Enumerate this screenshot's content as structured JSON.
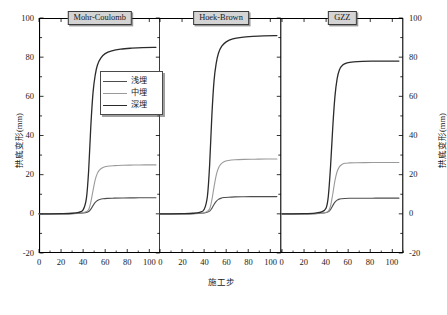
{
  "chart_data": {
    "type": "line",
    "title": "",
    "xlabel": "施工步",
    "ylabel": "拱底变形(mm)",
    "xlim": [
      0,
      110
    ],
    "ylim": [
      -20,
      100
    ],
    "xticks": [
      0,
      20,
      40,
      60,
      80,
      100
    ],
    "yticks": [
      -20,
      0,
      20,
      40,
      60,
      80,
      100
    ],
    "grid": false,
    "legend_position": "inside-left-panel-upper-right",
    "panels": [
      {
        "label": "Mohr-Coulomb",
        "series": [
          {
            "name": "浅埋",
            "color": "#4d4d4d",
            "width": 1.1,
            "plateau": 8.2,
            "x": [
              0,
              10,
              20,
              30,
              38,
              42,
              45,
              47,
              49,
              51,
              53,
              55,
              58,
              62,
              68,
              76,
              86,
              96,
              106
            ],
            "y": [
              0,
              0,
              0,
              0.1,
              0.3,
              0.6,
              1.2,
              2.4,
              4.2,
              5.8,
              6.8,
              7.3,
              7.7,
              7.9,
              8.0,
              8.1,
              8.15,
              8.2,
              8.2
            ]
          },
          {
            "name": "中埋",
            "color": "#9a9a9a",
            "width": 1.1,
            "plateau": 25.0,
            "x": [
              0,
              10,
              20,
              30,
              38,
              42,
              45,
              47,
              49,
              51,
              53,
              55,
              58,
              62,
              68,
              76,
              86,
              96,
              106
            ],
            "y": [
              0,
              0,
              0,
              0.1,
              0.4,
              0.9,
              2.2,
              6.0,
              12.0,
              17.5,
              20.8,
              22.5,
              23.7,
              24.3,
              24.6,
              24.8,
              24.9,
              25.0,
              25.0
            ]
          },
          {
            "name": "深埋",
            "color": "#2b2b2b",
            "width": 1.3,
            "plateau": 85.0,
            "x": [
              0,
              10,
              20,
              30,
              36,
              40,
              43,
              45,
              47,
              49,
              51,
              53,
              56,
              60,
              66,
              74,
              84,
              94,
              106
            ],
            "y": [
              0,
              0,
              0.1,
              0.3,
              0.8,
              2.0,
              8.0,
              22.0,
              45.0,
              62.0,
              71.0,
              76.0,
              79.5,
              81.8,
              83.2,
              84.1,
              84.6,
              84.9,
              85.0
            ]
          }
        ]
      },
      {
        "label": "Hoek-Brown",
        "series": [
          {
            "name": "浅埋",
            "color": "#4d4d4d",
            "width": 1.1,
            "plateau": 8.8,
            "x": [
              0,
              10,
              20,
              30,
              38,
              42,
              45,
              47,
              49,
              51,
              53,
              55,
              58,
              62,
              68,
              76,
              86,
              96,
              106
            ],
            "y": [
              0,
              0,
              0,
              0.1,
              0.3,
              0.7,
              1.4,
              2.8,
              4.8,
              6.4,
              7.4,
              7.9,
              8.3,
              8.5,
              8.65,
              8.72,
              8.78,
              8.8,
              8.8
            ]
          },
          {
            "name": "中埋",
            "color": "#9a9a9a",
            "width": 1.1,
            "plateau": 28.0,
            "x": [
              0,
              10,
              20,
              30,
              38,
              42,
              45,
              47,
              49,
              51,
              53,
              55,
              58,
              62,
              68,
              76,
              86,
              96,
              106
            ],
            "y": [
              0,
              0,
              0,
              0.1,
              0.4,
              1.0,
              2.6,
              7.0,
              13.8,
              19.8,
              23.4,
              25.3,
              26.6,
              27.2,
              27.6,
              27.8,
              27.9,
              28.0,
              28.0
            ]
          },
          {
            "name": "深埋",
            "color": "#2b2b2b",
            "width": 1.3,
            "plateau": 91.0,
            "x": [
              0,
              10,
              20,
              30,
              36,
              40,
              43,
              45,
              47,
              49,
              51,
              53,
              56,
              60,
              66,
              74,
              84,
              94,
              106
            ],
            "y": [
              0,
              0,
              0.1,
              0.3,
              0.8,
              2.2,
              9.0,
              25.0,
              50.0,
              68.0,
              77.0,
              82.0,
              85.6,
              87.8,
              89.3,
              90.1,
              90.6,
              90.9,
              91.0
            ]
          }
        ]
      },
      {
        "label": "GZZ",
        "series": [
          {
            "name": "浅埋",
            "color": "#4d4d4d",
            "width": 1.1,
            "plateau": 8.0,
            "x": [
              0,
              10,
              20,
              30,
              38,
              42,
              44,
              46,
              48,
              50,
              52,
              54,
              57,
              61,
              67,
              75,
              85,
              95,
              106
            ],
            "y": [
              0,
              0,
              0,
              0.1,
              0.4,
              1.0,
              2.2,
              4.2,
              6.0,
              7.0,
              7.5,
              7.7,
              7.85,
              7.92,
              7.96,
              7.98,
              8.0,
              8.0,
              8.0
            ]
          },
          {
            "name": "中埋",
            "color": "#9a9a9a",
            "width": 1.1,
            "plateau": 26.2,
            "x": [
              0,
              10,
              20,
              30,
              38,
              42,
              44,
              46,
              48,
              50,
              52,
              54,
              57,
              61,
              67,
              75,
              85,
              95,
              106
            ],
            "y": [
              0,
              0,
              0,
              0.1,
              0.5,
              1.4,
              4.0,
              10.0,
              17.0,
              21.6,
              24.0,
              25.1,
              25.8,
              26.0,
              26.1,
              26.15,
              26.2,
              26.2,
              26.2
            ]
          },
          {
            "name": "深埋",
            "color": "#2b2b2b",
            "width": 1.3,
            "plateau": 78.0,
            "x": [
              0,
              10,
              20,
              30,
              36,
              40,
              42,
              44,
              46,
              48,
              50,
              52,
              55,
              59,
              65,
              73,
              83,
              93,
              106
            ],
            "y": [
              0,
              0,
              0.1,
              0.4,
              1.0,
              3.0,
              9.0,
              24.0,
              44.0,
              60.0,
              69.0,
              73.5,
              76.0,
              77.1,
              77.6,
              77.85,
              77.95,
              78.0,
              78.0
            ]
          }
        ]
      }
    ],
    "legend": [
      {
        "label": "浅埋",
        "color": "#4d4d4d",
        "width": 1.1
      },
      {
        "label": "中埋",
        "color": "#9a9a9a",
        "width": 1.1
      },
      {
        "label": "深埋",
        "color": "#2b2b2b",
        "width": 1.3
      }
    ]
  }
}
